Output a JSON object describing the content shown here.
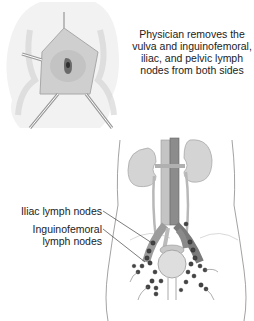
{
  "caption": {
    "lines": [
      "Physician removes the",
      "vulva and inguinofemoral,",
      "iliac, and pelvic lymph",
      "nodes from both sides"
    ]
  },
  "labels": {
    "iliac": "Iliac lymph nodes",
    "inguinofemoral_line1": "Inguinofemoral",
    "inguinofemoral_line2": "lymph nodes"
  },
  "colors": {
    "skin": "#ececec",
    "tissue": "#c8c8c8",
    "vessel_artery": "#a8a8a8",
    "vessel_vein": "#888888",
    "node": "#444444",
    "line": "#555555"
  }
}
